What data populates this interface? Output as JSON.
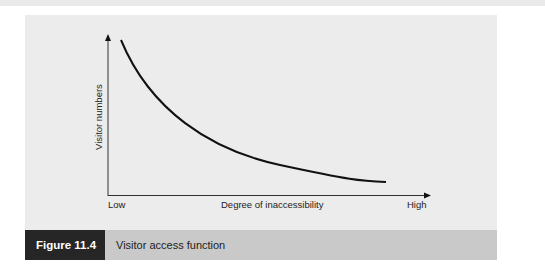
{
  "figure": {
    "label": "Figure 11.4",
    "title": "Visitor access function"
  },
  "axes": {
    "y_label": "Visitor numbers",
    "x_label": "Degree of inaccessibility",
    "x_low": "Low",
    "x_high": "High"
  },
  "colors": {
    "panel": "#ececec",
    "caption_bar": "#c9c9c9",
    "label_box": "#262626",
    "curve": "#111111"
  }
}
